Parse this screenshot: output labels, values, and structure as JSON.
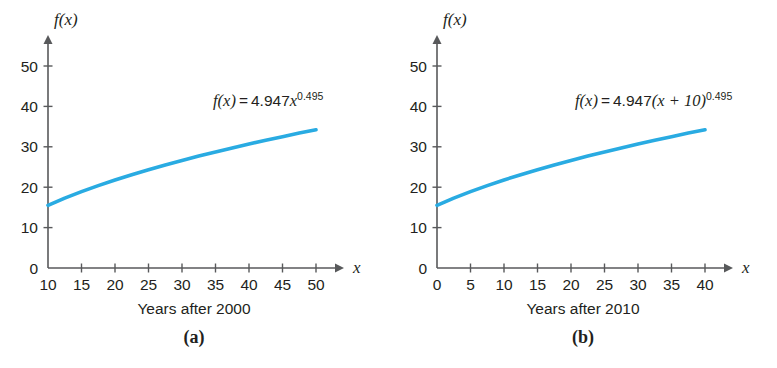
{
  "figure": {
    "background": "#ffffff",
    "curve_color": "#29abe2",
    "axis_color": "#58595b",
    "text_color": "#231f20"
  },
  "panels": [
    {
      "id": "a",
      "letter": "(a)",
      "xtitle": "Years after 2000",
      "yaxis_name": "f(x)",
      "xaxis_name": "x",
      "equation": {
        "lhs": "f(x)",
        "op": "=",
        "coefficient": "4.947",
        "variable": "x",
        "exponent": "0.495",
        "plain": "f(x) = 4.947x^0.495"
      },
      "chart_data": {
        "type": "line",
        "title": "",
        "xlabel": "Years after 2000",
        "ylabel": "f(x)",
        "xlim": [
          10,
          50
        ],
        "ylim": [
          0,
          55
        ],
        "grid": false,
        "legend": "none",
        "xticks": [
          10,
          15,
          20,
          25,
          30,
          35,
          40,
          45,
          50
        ],
        "yticks": [
          0,
          10,
          20,
          30,
          40,
          50
        ],
        "series": [
          {
            "name": "f(x) = 4.947x^0.495",
            "x": [
              10,
              12.5,
              15,
              17.5,
              20,
              22.5,
              25,
              27.5,
              30,
              32.5,
              35,
              37.5,
              40,
              42.5,
              45,
              47.5,
              50
            ],
            "values": [
              15.5,
              17.3,
              18.9,
              20.4,
              21.8,
              23.1,
              24.3,
              25.5,
              26.6,
              27.7,
              28.7,
              29.7,
              30.7,
              31.6,
              32.5,
              33.4,
              34.2
            ]
          }
        ]
      }
    },
    {
      "id": "b",
      "letter": "(b)",
      "xtitle": "Years after 2010",
      "yaxis_name": "f(x)",
      "xaxis_name": "x",
      "equation": {
        "lhs": "f(x)",
        "op": "=",
        "coefficient": "4.947",
        "variable": "(x + 10)",
        "exponent": "0.495",
        "plain": "f(x) = 4.947(x + 10)^0.495"
      },
      "chart_data": {
        "type": "line",
        "title": "",
        "xlabel": "Years after 2010",
        "ylabel": "f(x)",
        "xlim": [
          0,
          45
        ],
        "ylim": [
          0,
          55
        ],
        "grid": false,
        "legend": "none",
        "xticks": [
          0,
          5,
          10,
          15,
          20,
          25,
          30,
          35,
          40
        ],
        "yticks": [
          0,
          10,
          20,
          30,
          40,
          50
        ],
        "series": [
          {
            "name": "f(x) = 4.947(x + 10)^0.495",
            "x": [
              0,
              2.5,
              5,
              7.5,
              10,
              12.5,
              15,
              17.5,
              20,
              22.5,
              25,
              27.5,
              30,
              32.5,
              35,
              37.5,
              40
            ],
            "values": [
              15.5,
              17.3,
              18.9,
              20.4,
              21.8,
              23.1,
              24.3,
              25.5,
              26.6,
              27.7,
              28.7,
              29.7,
              30.7,
              31.6,
              32.5,
              33.4,
              34.2
            ]
          }
        ]
      }
    }
  ]
}
